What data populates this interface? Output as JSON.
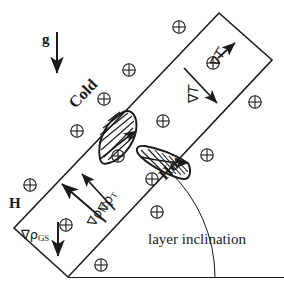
{
  "figure": {
    "background_color": "#ffffff",
    "line_color": "#1a1a1a"
  },
  "labels": {
    "gravity": "g",
    "magnetic_field": "H",
    "cold_wall": "Cold",
    "hot_wall": "Hot",
    "temperature_gradient": "∇T",
    "temperature_gradient_prime": "∇T′",
    "density_gradient_thermal_symbol": "∇ρ",
    "density_gradient_thermal_sub": "T",
    "density_gradient_fd_symbol": "∇ρ",
    "density_gradient_fd_sub": "FD",
    "density_gradient_gs_symbol": "∇ρ",
    "density_gradient_gs_sub": "GS",
    "inclination": "layer inclination"
  },
  "icons": {
    "field_marker": "⊕",
    "field_marker_name": "circled-plus-icon",
    "field_marker_count": 14
  },
  "field_markers": [
    {
      "x": 179,
      "y": 27
    },
    {
      "x": 129,
      "y": 70
    },
    {
      "x": 213,
      "y": 63
    },
    {
      "x": 255,
      "y": 102
    },
    {
      "x": 104,
      "y": 99
    },
    {
      "x": 77,
      "y": 131
    },
    {
      "x": 163,
      "y": 121
    },
    {
      "x": 207,
      "y": 155
    },
    {
      "x": 118,
      "y": 156
    },
    {
      "x": 152,
      "y": 179
    },
    {
      "x": 30,
      "y": 185
    },
    {
      "x": 157,
      "y": 212
    },
    {
      "x": 66,
      "y": 225
    },
    {
      "x": 101,
      "y": 265
    }
  ],
  "geometry": {
    "slab_corners": [
      [
        14,
        228
      ],
      [
        219,
        13
      ],
      [
        272,
        60
      ],
      [
        68,
        277
      ]
    ],
    "baseline_y": 277,
    "inclination_angle_deg": 46
  }
}
